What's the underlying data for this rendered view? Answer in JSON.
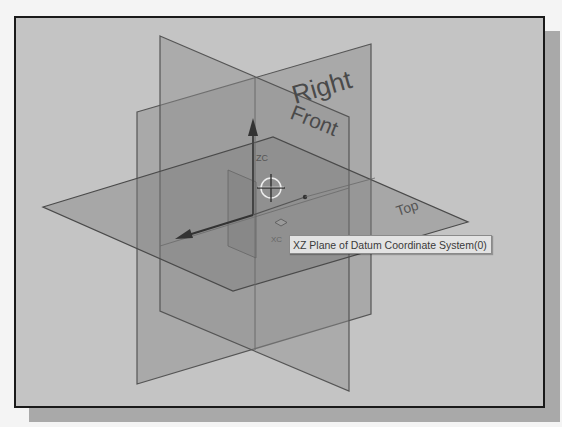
{
  "viewport": {
    "background": "#c4c4c4",
    "planes": [
      {
        "name": "Front",
        "label": "Front",
        "fill": "#8f8f8f",
        "opacity": 0.45,
        "points": "160,36 349,117 349,391 160,311"
      },
      {
        "name": "Right",
        "label": "Right",
        "fill": "#8a8a8a",
        "opacity": 0.45,
        "points": "137,112 371,44 371,314 137,384"
      },
      {
        "name": "Top",
        "label": "Top",
        "fill": "#7e7e7e",
        "opacity": 0.45,
        "points": "43,207 273,137 468,222 233,291"
      }
    ],
    "axes": {
      "zc_label": "ZC",
      "xc_label": "XC",
      "yc_label": "YC"
    },
    "cursor": "crosshair-select-icon"
  },
  "tooltip": {
    "icon": "plane-icon",
    "text": "XZ Plane of Datum Coordinate System(0)"
  }
}
